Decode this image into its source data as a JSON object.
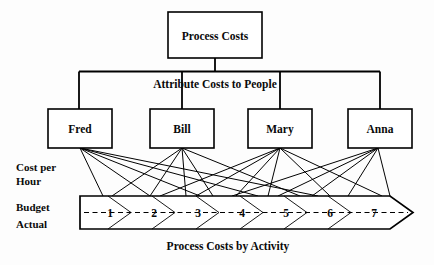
{
  "diagram": {
    "title_node": {
      "label": "Process Costs"
    },
    "mid_node": {
      "label": "Attribute Costs to People"
    },
    "people": [
      {
        "label": "Fred"
      },
      {
        "label": "Bill"
      },
      {
        "label": "Mary"
      },
      {
        "label": "Anna"
      }
    ],
    "side_labels": {
      "cost_line1": "Cost per",
      "cost_line2": "Hour",
      "budget": "Budget",
      "actual": "Actual"
    },
    "activity_band": {
      "segments": [
        "1",
        "2",
        "3",
        "4",
        "5",
        "6",
        "7"
      ],
      "caption": "Process Costs by Activity"
    },
    "colors": {
      "stroke": "#000000",
      "fill": "#ffffff",
      "background": "#fdfdfd"
    }
  }
}
